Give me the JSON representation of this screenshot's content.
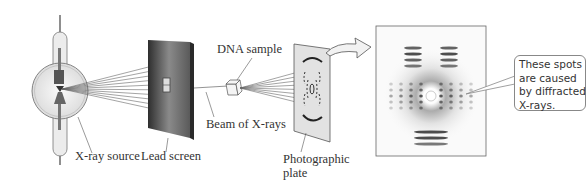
{
  "diagram": {
    "labels": {
      "xray_source": "X-ray source",
      "lead_screen": "Lead screen",
      "beam": "Beam of X-rays",
      "dna_sample": "DNA sample",
      "photographic_plate_line1": "Photographic",
      "photographic_plate_line2": "plate"
    },
    "callout": {
      "lines": [
        "These spots",
        "are caused",
        "by diffracted",
        "X-rays."
      ]
    },
    "colors": {
      "line": "#555555",
      "screen_dark": "#3a3a3a",
      "screen_light": "#9a9a9a",
      "plate": "#e2e2e2",
      "bulb": "#e9e9e9",
      "callout_border": "#888888"
    }
  }
}
